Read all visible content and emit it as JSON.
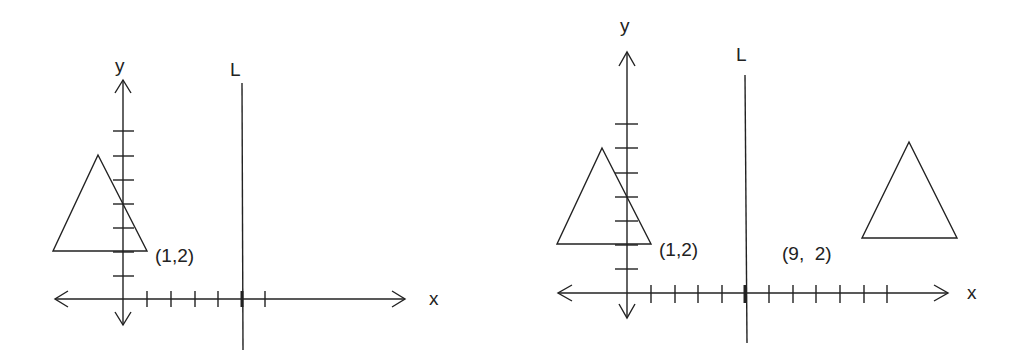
{
  "figures": [
    {
      "name": "before",
      "y_label": "y",
      "x_label": "",
      "line_label": "L",
      "point_label": "(1,2)"
    },
    {
      "name": "after",
      "y_label": "y",
      "x_label": "x",
      "line_label": "L",
      "point_label": "(1,2)",
      "image_point_label": "(9,  2)"
    }
  ],
  "left_x_label": "x",
  "colors": {
    "stroke": "#222222",
    "background": "#ffffff"
  }
}
